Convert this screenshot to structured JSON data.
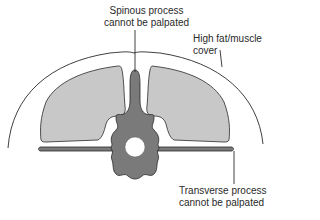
{
  "diagram": {
    "labels": {
      "spinous": {
        "line1": "Spinous process",
        "line2": "cannot be palpated"
      },
      "fat": {
        "line1": "High fat/muscle",
        "line2": "cover"
      },
      "transverse": {
        "line1": "Transverse process",
        "line2": "cannot be palpated"
      }
    },
    "colors": {
      "outline": "#2a2a2a",
      "muscle_fill": "#c8c8c8",
      "bone_fill": "#7a7a7a",
      "background": "#ffffff",
      "canal": "#ffffff"
    }
  }
}
